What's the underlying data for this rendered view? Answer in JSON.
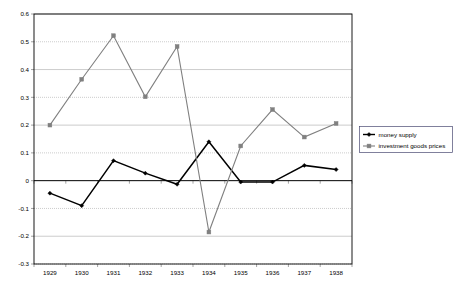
{
  "chart_data": {
    "type": "line",
    "title": "",
    "xlabel": "",
    "ylabel": "",
    "categories": [
      "1929",
      "1930",
      "1931",
      "1932",
      "1933",
      "1934",
      "1935",
      "1936",
      "1937",
      "1938"
    ],
    "ylim": [
      -0.3,
      0.6
    ],
    "y_ticks": [
      "0.6",
      "0.5",
      "0.4",
      "0.3",
      "0.2",
      "0.1",
      "0",
      "-0.1",
      "-0.2",
      "-0.3"
    ],
    "y_tick_values": [
      0.6,
      0.5,
      0.4,
      0.3,
      0.2,
      0.1,
      0,
      -0.1,
      -0.2,
      -0.3
    ],
    "grid": true,
    "legend_position": "right",
    "series": [
      {
        "name": "money supply",
        "color": "#000000",
        "marker": "diamond",
        "values": [
          -0.045,
          -0.09,
          0.072,
          0.027,
          -0.013,
          0.14,
          -0.005,
          -0.005,
          0.055,
          0.04
        ]
      },
      {
        "name": "investment goods prices",
        "color": "#808080",
        "marker": "square",
        "values": [
          0.2,
          0.365,
          0.522,
          0.302,
          0.483,
          -0.185,
          0.125,
          0.256,
          0.157,
          0.206
        ]
      }
    ]
  },
  "legend": {
    "items": [
      {
        "label": "money supply"
      },
      {
        "label": "investment goods prices"
      }
    ]
  }
}
